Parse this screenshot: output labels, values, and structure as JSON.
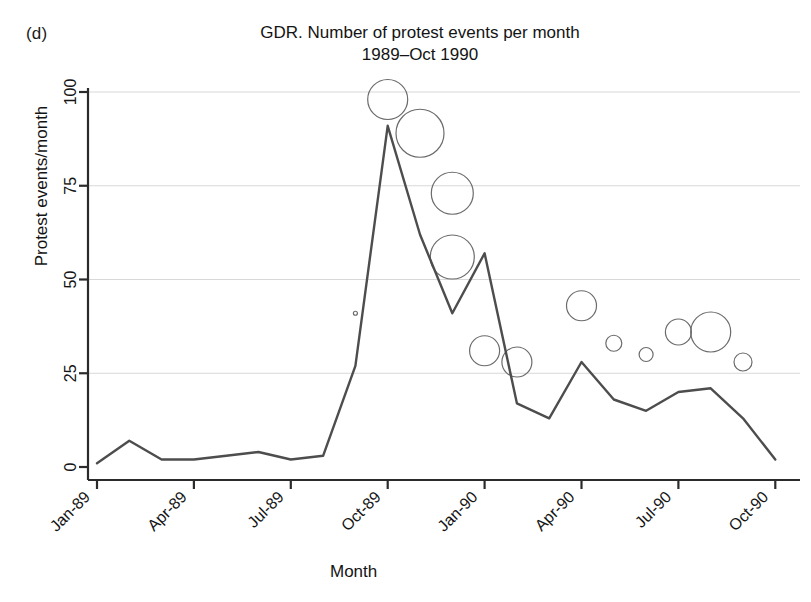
{
  "figure": {
    "panel_label": "(d)",
    "title_line1": "GDR. Number of protest events per month",
    "title_line2": "1989–Oct 1990",
    "xlabel": "Month",
    "ylabel": "Protest events/month",
    "line_color": "#4d4d4d",
    "bubble_color": "#6b6b6b",
    "grid_color": "#d8d8d8",
    "axis_color": "#2b2b2b"
  },
  "chart_data": {
    "type": "line",
    "title": "GDR. Number of protest events per month 1989–Oct 1990",
    "xlabel": "Month",
    "ylabel": "Protest events/month",
    "ylim": [
      0,
      100
    ],
    "yticks": [
      0,
      25,
      50,
      75,
      100
    ],
    "ytick_labels": [
      "0",
      "25",
      "50",
      "75",
      "100"
    ],
    "xticks": [
      "Jan-89",
      "Apr-89",
      "Jul-89",
      "Oct-89",
      "Jan-90",
      "Apr-90",
      "Jul-90",
      "Oct-90"
    ],
    "grid": true,
    "legend": null,
    "x": [
      "Jan-89",
      "Feb-89",
      "Mar-89",
      "Apr-89",
      "May-89",
      "Jun-89",
      "Jul-89",
      "Aug-89",
      "Sep-89",
      "Oct-89",
      "Nov-89",
      "Dec-89",
      "Jan-90",
      "Feb-90",
      "Mar-90",
      "Apr-90",
      "May-90",
      "Jun-90",
      "Jul-90",
      "Aug-90",
      "Sep-90",
      "Oct-90"
    ],
    "series": [
      {
        "name": "Protest events/month",
        "values": [
          1,
          7,
          2,
          2,
          3,
          4,
          2,
          3,
          27,
          91,
          62,
          41,
          57,
          17,
          13,
          28,
          18,
          15,
          20,
          21,
          13,
          2
        ]
      }
    ],
    "bubbles": [
      {
        "x": "Sep-89",
        "y": 41,
        "size": 2
      },
      {
        "x": "Oct-89",
        "y": 98,
        "size": 20
      },
      {
        "x": "Nov-89",
        "y": 89,
        "size": 24
      },
      {
        "x": "Dec-89",
        "y": 56,
        "size": 22
      },
      {
        "x": "Dec-89",
        "y": 73,
        "size": 21
      },
      {
        "x": "Jan-90",
        "y": 31,
        "size": 15
      },
      {
        "x": "Feb-90",
        "y": 28,
        "size": 15
      },
      {
        "x": "Apr-90",
        "y": 43,
        "size": 15
      },
      {
        "x": "May-90",
        "y": 33,
        "size": 8
      },
      {
        "x": "Jun-90",
        "y": 30,
        "size": 7
      },
      {
        "x": "Jul-90",
        "y": 36,
        "size": 13
      },
      {
        "x": "Aug-90",
        "y": 36,
        "size": 20
      },
      {
        "x": "Sep-90",
        "y": 28,
        "size": 9
      }
    ]
  }
}
